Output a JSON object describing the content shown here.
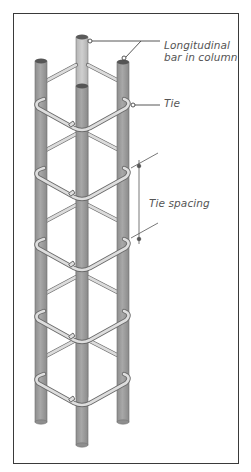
{
  "diagram": {
    "labels": {
      "longitudinal_line1": "Longitudinal",
      "longitudinal_line2": "bar in column",
      "tie": "Tie",
      "tie_spacing": "Tie spacing"
    },
    "components": {
      "longitudinal_bars": 4,
      "ties_visible": 5
    },
    "colors": {
      "bar_fill": "#a0a0a0",
      "bar_back_fill": "#c4c4c4",
      "bar_cap": "#5a5a5a",
      "tie_fill": "#d8d8d8",
      "tie_stroke": "#6a6a6a",
      "frame": "#3a3a3a",
      "leader": "#444444",
      "text": "#555555"
    }
  }
}
